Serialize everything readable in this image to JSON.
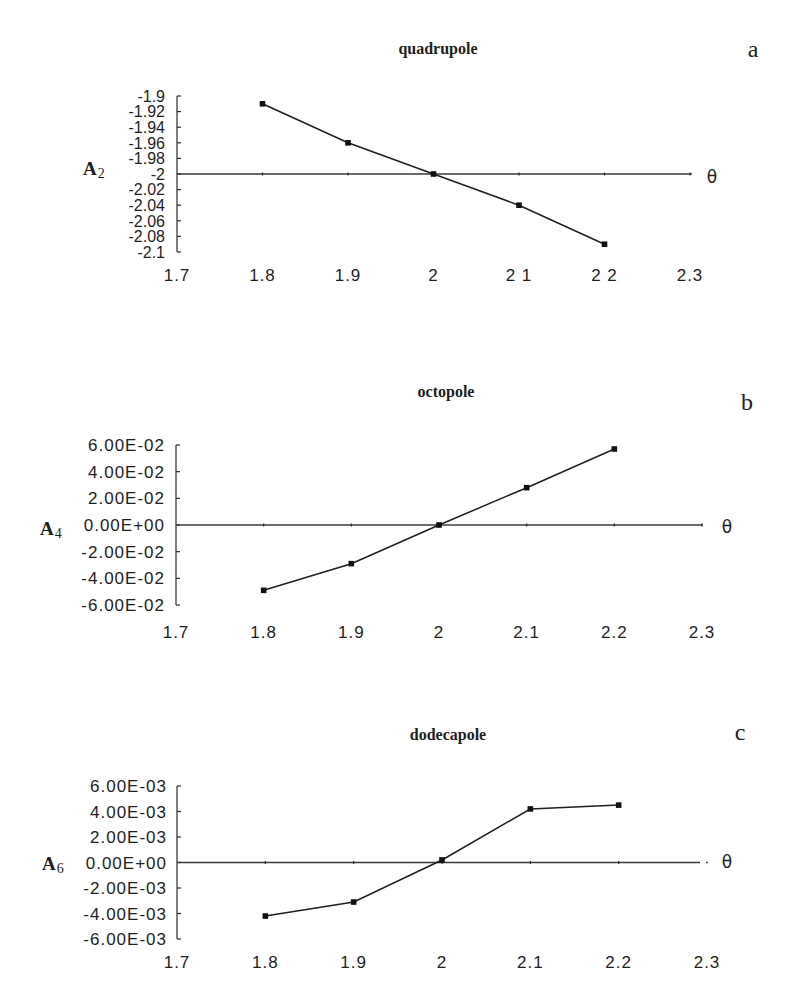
{
  "figure": {
    "panel_count": 3
  },
  "chart_data": [
    {
      "type": "line",
      "panel_label": "a",
      "title": "quadrupole",
      "xlabel": "θ",
      "ylabel": "A2",
      "ylabel_main": "A",
      "ylabel_sub": "2",
      "x": [
        1.8,
        1.9,
        2.0,
        2.1,
        2.2
      ],
      "series": [
        {
          "name": "A2",
          "values": [
            -1.91,
            -1.96,
            -2.0,
            -2.04,
            -2.09
          ]
        }
      ],
      "xlim": [
        1.7,
        2.3
      ],
      "ylim": [
        -2.1,
        -1.9
      ],
      "xticks": [
        1.7,
        1.8,
        1.9,
        2.0,
        2.1,
        2.2,
        2.3
      ],
      "xtick_labels": [
        "1.7",
        "1.8",
        "1.9",
        "2",
        "2 1",
        "2 2",
        "2.3"
      ],
      "yticks": [
        -1.9,
        -1.92,
        -1.94,
        -1.96,
        -1.98,
        -2.0,
        -2.02,
        -2.04,
        -2.06,
        -2.08,
        -2.1
      ],
      "ytick_labels": [
        "-1.9",
        "-1.92",
        "-1.94",
        "-1.96",
        "-1.98",
        "-2",
        "-2.02",
        "-2.04",
        "-2.06",
        "-2.08",
        "-2.1"
      ],
      "baseline": -2.0,
      "grid": false,
      "legend": null,
      "marker": "square"
    },
    {
      "type": "line",
      "panel_label": "b",
      "title": "octopole",
      "xlabel": "θ",
      "ylabel": "A4",
      "ylabel_main": "A",
      "ylabel_sub": "4",
      "x": [
        1.8,
        1.9,
        2.0,
        2.1,
        2.2
      ],
      "series": [
        {
          "name": "A4",
          "values": [
            -0.049,
            -0.029,
            0.0,
            0.028,
            0.057
          ]
        }
      ],
      "xlim": [
        1.7,
        2.3
      ],
      "ylim": [
        -0.06,
        0.06
      ],
      "xticks": [
        1.7,
        1.8,
        1.9,
        2.0,
        2.1,
        2.2,
        2.3
      ],
      "xtick_labels": [
        "1.7",
        "1.8",
        "1.9",
        "2",
        "2.1",
        "2.2",
        "2.3"
      ],
      "yticks": [
        0.06,
        0.04,
        0.02,
        0.0,
        -0.02,
        -0.04,
        -0.06
      ],
      "ytick_labels": [
        "6.00E-02",
        "4.00E-02",
        "2.00E-02",
        "0.00E+00",
        "-2.00E-02",
        "-4.00E-02",
        "-6.00E-02"
      ],
      "baseline": 0.0,
      "grid": false,
      "legend": null,
      "marker": "square"
    },
    {
      "type": "line",
      "panel_label": "c",
      "title": "dodecapole",
      "xlabel": "θ",
      "ylabel": "A6",
      "ylabel_main": "A",
      "ylabel_sub": "6",
      "x": [
        1.8,
        1.9,
        2.0,
        2.1,
        2.2
      ],
      "series": [
        {
          "name": "A6",
          "values": [
            -0.0042,
            -0.0031,
            0.0002,
            0.0042,
            0.0045
          ]
        }
      ],
      "xlim": [
        1.7,
        2.3
      ],
      "ylim": [
        -0.006,
        0.006
      ],
      "xticks": [
        1.7,
        1.8,
        1.9,
        2.0,
        2.1,
        2.2,
        2.3
      ],
      "xtick_labels": [
        "1.7",
        "1.8",
        "1.9",
        "2",
        "2.1",
        "2.2",
        "2.3"
      ],
      "yticks": [
        0.006,
        0.004,
        0.002,
        0.0,
        -0.002,
        -0.004,
        -0.006
      ],
      "ytick_labels": [
        "6.00E-03",
        "4.00E-03",
        "2.00E-03",
        "0.00E+00",
        "-2.00E-03",
        "-4.00E-03",
        "-6.00E-03"
      ],
      "baseline": 0.0,
      "grid": false,
      "legend": null,
      "marker": "square"
    }
  ]
}
